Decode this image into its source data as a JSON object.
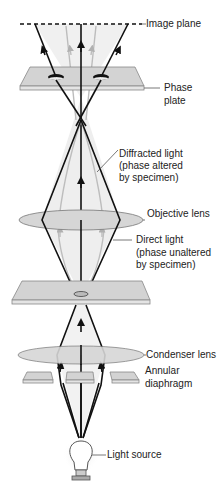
{
  "diagram": {
    "labels": {
      "image_plane": "Image plane",
      "phase_plate_1": "Phase",
      "phase_plate_2": "plate",
      "diffracted_1": "Diffracted light",
      "diffracted_2": "(phase altered",
      "diffracted_3": "by specimen)",
      "objective_lens": "Objective lens",
      "direct_1": "Direct light",
      "direct_2": "(phase unaltered",
      "direct_3": "by specimen)",
      "condenser_lens": "Condenser lens",
      "annular_1": "Annular",
      "annular_2": "diaphragm",
      "light_source": "Light source"
    },
    "colors": {
      "ray": "#111111",
      "diffracted_ray": "#b8b8b8",
      "cone_fill": "#ececec",
      "plate_fill": "#cfcfcf",
      "lens_fill": "#d4d4d4"
    }
  }
}
